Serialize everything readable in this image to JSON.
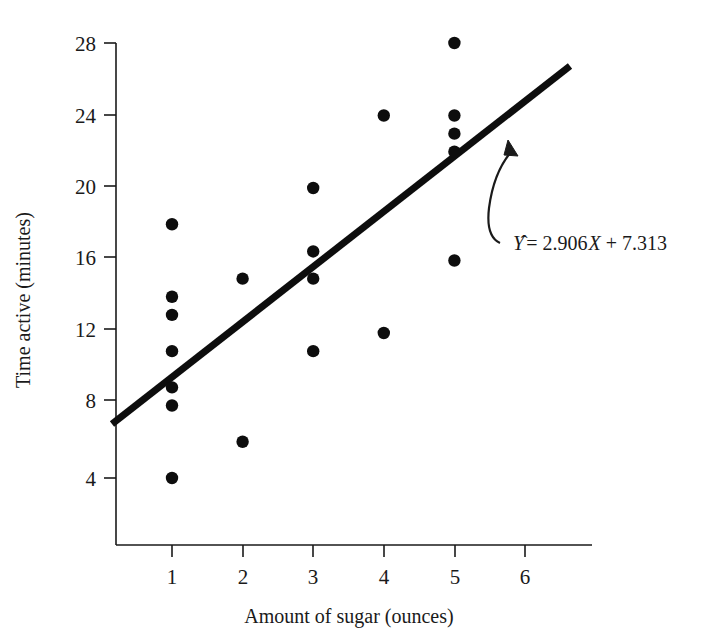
{
  "chart_data": {
    "type": "scatter",
    "title": "",
    "xlabel": "Amount of sugar (ounces)",
    "ylabel": "Time active (minutes)",
    "xlim": [
      0,
      6.6
    ],
    "ylim": [
      0,
      29.2
    ],
    "grid": false,
    "legend": false,
    "x_ticks": [
      1,
      2,
      3,
      4,
      5,
      6
    ],
    "x_tick_labels": [
      "1",
      "2",
      "3",
      "4",
      "5",
      "6"
    ],
    "y_ticks": [
      4,
      8,
      12,
      16,
      20,
      24,
      28
    ],
    "y_tick_labels": [
      "4",
      "8",
      "12",
      "16",
      "20",
      "24",
      "28"
    ],
    "points": [
      {
        "x": 1,
        "y": 18
      },
      {
        "x": 1,
        "y": 14
      },
      {
        "x": 1,
        "y": 13
      },
      {
        "x": 1,
        "y": 11
      },
      {
        "x": 1,
        "y": 9
      },
      {
        "x": 1,
        "y": 8
      },
      {
        "x": 1,
        "y": 4
      },
      {
        "x": 2,
        "y": 15
      },
      {
        "x": 2,
        "y": 6
      },
      {
        "x": 3,
        "y": 20
      },
      {
        "x": 3,
        "y": 16.5
      },
      {
        "x": 3,
        "y": 15
      },
      {
        "x": 3,
        "y": 11
      },
      {
        "x": 4,
        "y": 24
      },
      {
        "x": 4,
        "y": 12
      },
      {
        "x": 5,
        "y": 28
      },
      {
        "x": 5,
        "y": 24
      },
      {
        "x": 5,
        "y": 23
      },
      {
        "x": 5,
        "y": 22
      },
      {
        "x": 5,
        "y": 16
      }
    ],
    "regression": {
      "slope": 2.906,
      "intercept": 7.313,
      "x_start": 0.0,
      "x_end": 5.65,
      "equation_text": "= 2.906",
      "equation_symbol": "Y",
      "equation_x_var": "X",
      "equation_tail": "+ 7.313",
      "equation_full": "Ŷ = 2.906X + 7.313"
    },
    "annotation": {
      "label": "regression-equation",
      "text": "Ŷ = 2.906X + 7.313"
    },
    "colors": {
      "point": "#0d0d0d",
      "line": "#0d0d0d",
      "axis": "#1a1a1a",
      "background": "#ffffff"
    }
  }
}
